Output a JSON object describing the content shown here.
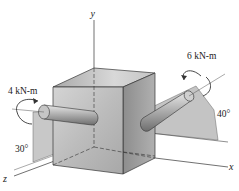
{
  "figure": {
    "axes": {
      "x": "x",
      "y": "y",
      "z": "z"
    },
    "torques": [
      {
        "label": "4 kN-m",
        "angle_label": "30°",
        "side": "left"
      },
      {
        "label": "6 kN-m",
        "angle_label": "40°",
        "side": "right"
      }
    ],
    "colors": {
      "cube_front": "#b8b8b8",
      "cube_top": "#cfcfcf",
      "cube_right": "#9a9a9a",
      "plane": "#c9c9c9",
      "line": "#333333"
    }
  }
}
